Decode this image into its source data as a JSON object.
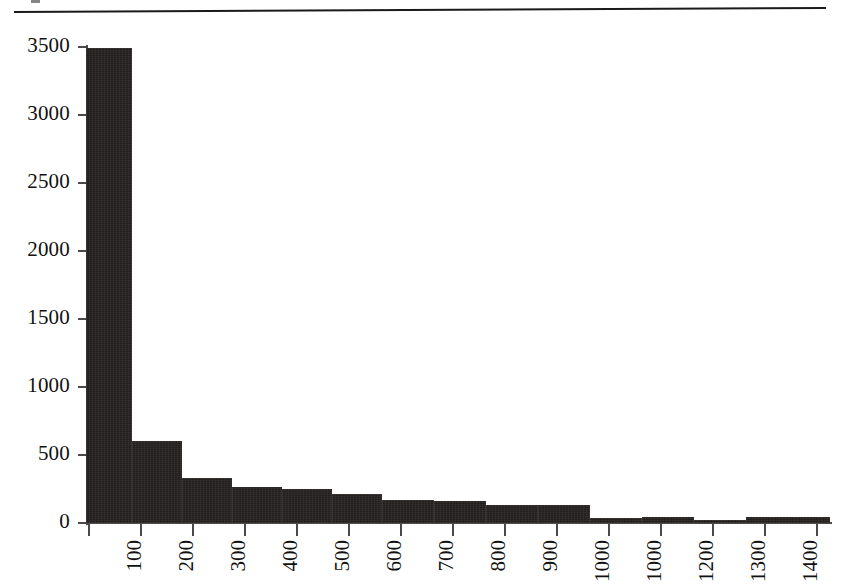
{
  "page": {
    "background_color": "#ffffff",
    "ink_color": "#231f1e",
    "rule_color": "#1a1a1a"
  },
  "chart_data": {
    "type": "bar",
    "title": "",
    "subtitle": "",
    "xlabel": "",
    "ylabel": "",
    "grid": false,
    "legend": null,
    "legend_position": "none",
    "orientation": "vertical",
    "bar_color": "#231f1e",
    "axis_color": "#4a4a4a",
    "ylim": [
      0,
      3500
    ],
    "y_ticks": [
      0,
      500,
      1000,
      1500,
      2000,
      2500,
      3000,
      3500
    ],
    "y_tick_labels": [
      "0",
      "500",
      "1000",
      "1500",
      "2000",
      "2500",
      "3000",
      "3500"
    ],
    "x_tick_labels": [
      "100",
      "200",
      "300",
      "400",
      "500",
      "600",
      "700",
      "800",
      "900",
      "1000",
      "1000",
      "1200",
      "1300",
      "1400"
    ],
    "x_tick_label_rotation": -90,
    "categories": [
      "100",
      "200",
      "300",
      "400",
      "500",
      "600",
      "700",
      "800",
      "900",
      "1000",
      "1000",
      "1200",
      "1300",
      "1400"
    ],
    "values": [
      3490,
      600,
      330,
      265,
      250,
      215,
      170,
      160,
      130,
      130,
      35,
      45,
      25,
      45
    ],
    "series": [
      {
        "name": "count",
        "values": [
          3490,
          600,
          330,
          265,
          250,
          215,
          170,
          160,
          130,
          130,
          35,
          45,
          25,
          45
        ]
      }
    ]
  },
  "bars": [
    {
      "label": "100",
      "value": 3490,
      "x": 86,
      "width": 46
    },
    {
      "label": "200",
      "value": 600,
      "x": 132,
      "width": 50
    },
    {
      "label": "300",
      "value": 330,
      "x": 182,
      "width": 50
    },
    {
      "label": "400",
      "value": 265,
      "x": 232,
      "width": 50
    },
    {
      "label": "500",
      "value": 250,
      "x": 282,
      "width": 50
    },
    {
      "label": "600",
      "value": 215,
      "x": 332,
      "width": 50
    },
    {
      "label": "700",
      "value": 170,
      "x": 382,
      "width": 52
    },
    {
      "label": "800",
      "value": 160,
      "x": 434,
      "width": 52
    },
    {
      "label": "900",
      "value": 130,
      "x": 486,
      "width": 52
    },
    {
      "label": "1000",
      "value": 130,
      "x": 538,
      "width": 52
    },
    {
      "label": "1000",
      "value": 35,
      "x": 590,
      "width": 52
    },
    {
      "label": "1200",
      "value": 45,
      "x": 642,
      "width": 52
    },
    {
      "label": "1300",
      "value": 25,
      "x": 694,
      "width": 52
    },
    {
      "label": "1400",
      "value": 45,
      "x": 746,
      "width": 84
    }
  ],
  "x_ticks_px": [
    88,
    140,
    192,
    244,
    296,
    348,
    400,
    452,
    504,
    556,
    608,
    660,
    712,
    764,
    816
  ]
}
